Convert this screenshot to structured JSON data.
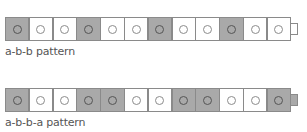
{
  "patterns": [
    {
      "label": "a-b-b pattern",
      "sequence": [
        "a",
        "b",
        "b",
        "a",
        "b",
        "b",
        "a",
        "b",
        "b",
        "a",
        "b",
        "b"
      ],
      "end_connector": "b"
    },
    {
      "label": "a-b-b-a pattern",
      "sequence": [
        "a",
        "b",
        "b",
        "a",
        "a",
        "b",
        "b",
        "a",
        "a",
        "b",
        "b",
        "a"
      ],
      "end_connector": "a"
    }
  ],
  "colors": {
    "a": "#a9a9a9",
    "b": "#ffffff"
  }
}
